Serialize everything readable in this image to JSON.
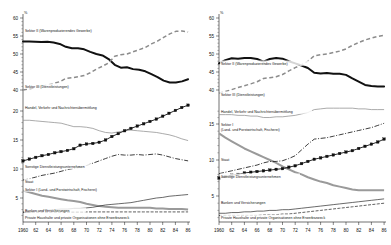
{
  "figure": {
    "unit_symbol": "%",
    "panels": [
      "left",
      "right"
    ]
  },
  "chart_data": [
    {
      "id": "left",
      "type": "line",
      "title": "",
      "xlabel": "",
      "ylabel": "%",
      "grid": false,
      "legend": "inline-labels",
      "x": [
        1960,
        1961,
        1962,
        1963,
        1964,
        1965,
        1966,
        1967,
        1968,
        1969,
        1970,
        1971,
        1972,
        1973,
        1974,
        1975,
        1976,
        1977,
        1978,
        1979,
        1980,
        1981,
        1982,
        1983,
        1984,
        1985,
        1986
      ],
      "xtick_labels": [
        "1960",
        "62",
        "64",
        "66",
        "68",
        "70",
        "72",
        "74",
        "76",
        "78",
        "80",
        "82",
        "84",
        "86"
      ],
      "ytick_labels_upper": [
        "60",
        "55",
        "50",
        "45",
        "40"
      ],
      "ytick_labels_lower": [
        "20",
        "15",
        "10",
        "5"
      ],
      "ylim_upper": [
        38,
        60
      ],
      "ylim_lower": [
        2,
        21
      ],
      "axis_break": true,
      "series": [
        {
          "name": "Sektor II (Warenproduzierendes Gewerbe)",
          "style": "thick-solid-black",
          "axis": "upper",
          "values": [
            53.5,
            53.5,
            53.4,
            53.3,
            53.4,
            53.2,
            52.8,
            52.0,
            51.6,
            51.6,
            51.3,
            50.6,
            50.0,
            49.6,
            48.6,
            47.0,
            46.2,
            46.3,
            45.8,
            45.6,
            45.2,
            44.4,
            43.6,
            42.6,
            42.1,
            42.1,
            42.4,
            43.0
          ]
        },
        {
          "name": "Sektor III (Dienstleistungen)",
          "style": "dashed-grey",
          "axis": "upper",
          "values": [
            40.0,
            40.3,
            40.7,
            41.0,
            41.4,
            41.8,
            42.3,
            43.2,
            43.4,
            43.7,
            44.0,
            44.8,
            45.8,
            46.6,
            47.5,
            49.4,
            49.8,
            50.0,
            50.6,
            51.2,
            51.8,
            52.8,
            53.6,
            54.6,
            55.6,
            56.3,
            56.4,
            56.1
          ]
        },
        {
          "name": "Handel, Verkehr und Nachrichtenübermittlung",
          "style": "thin-grey",
          "axis": "lower",
          "values": [
            18.4,
            18.4,
            18.3,
            18.2,
            18.1,
            18.0,
            17.9,
            17.6,
            17.3,
            17.3,
            17.2,
            17.0,
            16.6,
            16.3,
            16.2,
            16.4,
            16.6,
            16.7,
            16.6,
            16.5,
            16.4,
            16.3,
            16.1,
            15.9,
            15.6,
            15.2,
            14.9
          ]
        },
        {
          "name": "Sonstige Dienstleistungsunternehmen",
          "style": "marker-line-black",
          "axis": "lower",
          "values": [
            11.4,
            11.7,
            12.0,
            12.3,
            12.5,
            12.8,
            13.0,
            13.2,
            13.5,
            14.1,
            14.3,
            14.4,
            14.6,
            15.0,
            15.6,
            16.1,
            16.6,
            17.0,
            17.4,
            17.8,
            18.2,
            18.6,
            19.1,
            19.6,
            20.1,
            20.6,
            21.0
          ]
        },
        {
          "name": "Staat",
          "style": "dash-dot-black",
          "axis": "lower",
          "values": [
            8.1,
            8.3,
            8.6,
            8.9,
            9.1,
            9.3,
            9.6,
            9.9,
            10.1,
            10.3,
            10.6,
            11.0,
            11.4,
            11.8,
            12.2,
            12.5,
            12.4,
            12.4,
            12.5,
            12.4,
            12.5,
            12.6,
            12.4,
            12.1,
            11.8,
            11.6,
            11.4
          ]
        },
        {
          "name": "Sektor I (Land- und Forstwirtschaft, Fischerei)",
          "style": "grey-thick",
          "axis": "lower",
          "values": [
            6.3,
            6.0,
            5.7,
            5.4,
            5.2,
            5.0,
            4.8,
            4.6,
            4.5,
            4.3,
            4.0,
            3.8,
            3.6,
            3.5,
            3.4,
            3.3,
            3.3,
            3.3,
            3.3,
            3.3,
            3.3,
            3.2,
            3.2,
            3.1,
            3.1,
            3.1,
            3.0
          ]
        },
        {
          "name": "Banken und Versicherungen",
          "style": "solid-thin-black",
          "axis": "lower",
          "values": [
            2.5,
            2.6,
            2.7,
            2.8,
            2.9,
            3.0,
            3.1,
            3.1,
            3.2,
            3.2,
            3.3,
            3.4,
            3.6,
            3.8,
            3.9,
            4.0,
            4.1,
            4.2,
            4.4,
            4.6,
            4.8,
            5.0,
            5.1,
            5.3,
            5.4,
            5.5,
            5.6
          ]
        },
        {
          "name": "Private Haushalte und private Organisationen ohne Erwerbszweck",
          "style": "dashed-fine-black",
          "axis": "lower",
          "values": [
            2.6,
            2.6,
            2.6,
            2.6,
            2.6,
            2.6,
            2.6,
            2.6,
            2.6,
            2.6,
            2.6,
            2.6,
            2.6,
            2.6,
            2.6,
            2.6,
            2.6,
            2.6,
            2.6,
            2.6,
            2.6,
            2.6,
            2.6,
            2.6,
            2.6,
            2.6,
            2.6
          ]
        }
      ]
    },
    {
      "id": "right",
      "type": "line",
      "title": "",
      "xlabel": "",
      "ylabel": "%",
      "grid": false,
      "legend": "inline-labels",
      "x": [
        1960,
        1961,
        1962,
        1963,
        1964,
        1965,
        1966,
        1967,
        1968,
        1969,
        1970,
        1971,
        1972,
        1973,
        1974,
        1975,
        1976,
        1977,
        1978,
        1979,
        1980,
        1981,
        1982,
        1983,
        1984,
        1985,
        1986
      ],
      "xtick_labels": [
        "1960",
        "62",
        "64",
        "66",
        "68",
        "70",
        "72",
        "74",
        "76",
        "78",
        "80",
        "82",
        "84",
        "86"
      ],
      "ytick_labels_upper": [
        "60",
        "55",
        "50",
        "45",
        "40"
      ],
      "ytick_labels_lower": [
        "15",
        "10",
        "5"
      ],
      "ylim_upper": [
        38,
        60
      ],
      "ylim_lower": [
        2,
        17
      ],
      "axis_break": true,
      "series": [
        {
          "name": "Sektor II (Warenproduzierendes Gewerbe)",
          "style": "thick-solid-black",
          "axis": "upper",
          "values": [
            47.4,
            48.3,
            48.8,
            48.7,
            48.9,
            48.9,
            48.6,
            47.9,
            48.6,
            48.9,
            48.7,
            48.0,
            47.4,
            46.8,
            46.1,
            44.8,
            44.6,
            44.7,
            44.5,
            44.5,
            44.2,
            43.2,
            42.3,
            41.4,
            41.1,
            41.0,
            41.0
          ]
        },
        {
          "name": "Sektor III (Dienstleistungen)",
          "style": "dashed-grey",
          "axis": "upper",
          "values": [
            39.1,
            39.6,
            40.1,
            40.7,
            41.2,
            41.7,
            42.3,
            43.2,
            43.4,
            43.7,
            44.3,
            45.3,
            46.2,
            47.0,
            48.0,
            49.5,
            49.8,
            50.0,
            50.4,
            50.8,
            51.4,
            52.4,
            53.2,
            53.9,
            54.4,
            54.9,
            55.2
          ]
        },
        {
          "name": "Handel, Verkehr und Nachrichtenübermittlung",
          "style": "thin-grey",
          "axis": "lower",
          "values": [
            16.3,
            16.3,
            16.3,
            16.2,
            16.2,
            16.1,
            16.1,
            15.9,
            15.9,
            16.0,
            16.0,
            16.1,
            16.2,
            16.4,
            16.6,
            17.0,
            17.1,
            17.2,
            17.2,
            17.2,
            17.2,
            17.2,
            17.1,
            17.1,
            17.0,
            17.0,
            17.0
          ]
        },
        {
          "name": "Sektor I (Land- und Forstwirtschaft, Fischerei)",
          "style": "grey-thick",
          "axis": "lower",
          "values": [
            13.7,
            13.1,
            12.6,
            12.1,
            11.6,
            11.2,
            10.8,
            10.4,
            10.0,
            9.6,
            9.1,
            8.7,
            8.3,
            8.0,
            7.6,
            7.3,
            7.0,
            6.8,
            6.5,
            6.3,
            6.1,
            5.9,
            5.8,
            5.8,
            5.8,
            5.8,
            5.8
          ]
        },
        {
          "name": "Staat",
          "style": "dash-dot-black",
          "axis": "lower",
          "values": [
            8.1,
            8.3,
            8.5,
            8.7,
            8.9,
            9.1,
            9.3,
            9.6,
            9.8,
            9.8,
            9.9,
            10.2,
            10.6,
            11.4,
            12.2,
            12.9,
            13.0,
            13.1,
            13.3,
            13.5,
            13.7,
            13.9,
            14.1,
            14.3,
            14.5,
            14.8,
            15.1
          ]
        },
        {
          "name": "Sonstige Dienstleistungsunternehmen",
          "style": "marker-line-black",
          "axis": "lower",
          "values": [
            7.5,
            7.7,
            7.9,
            8.0,
            8.2,
            8.3,
            8.4,
            8.5,
            8.6,
            8.7,
            8.8,
            9.0,
            9.2,
            9.5,
            9.8,
            10.1,
            10.3,
            10.5,
            10.7,
            10.9,
            11.1,
            11.3,
            11.6,
            11.9,
            12.2,
            12.5,
            12.9
          ]
        },
        {
          "name": "Banken und Versicherungen",
          "style": "solid-thin-black",
          "axis": "lower",
          "values": [
            2.6,
            2.6,
            2.7,
            2.7,
            2.8,
            2.8,
            2.9,
            2.9,
            3.0,
            3.0,
            3.1,
            3.1,
            3.2,
            3.3,
            3.4,
            3.5,
            3.6,
            3.7,
            3.8,
            3.9,
            4.0,
            4.1,
            4.2,
            4.3,
            4.4,
            4.5,
            4.6
          ]
        },
        {
          "name": "Private Haushalte und private Organisationen ohne Erwerbszweck",
          "style": "dashed-fine-black",
          "axis": "lower",
          "values": [
            2.3,
            2.3,
            2.3,
            2.3,
            2.3,
            2.3,
            2.3,
            2.4,
            2.4,
            2.4,
            2.5,
            2.5,
            2.6,
            2.7,
            2.8,
            2.9,
            3.0,
            3.1,
            3.2,
            3.3,
            3.4,
            3.5,
            3.6,
            3.7,
            3.8,
            3.9,
            4.0
          ]
        }
      ]
    }
  ],
  "labels": {
    "left": {
      "sektor2": "Sektor II (Warenproduzierendes Gewerbe)",
      "sektor3": "Sektor III (Dienstleistungen)",
      "handel": "Handel, Verkehr und Nachrichtenübermittlung",
      "sonstige": "Sonstige Dienstleistungsunternehmen",
      "staat": "Staat",
      "sektor1": "Sektor I (Land- und Forstwirtschaft, Fischerei)",
      "banken": "Banken und Versicherungen",
      "haushalte": "Private Haushalte und private Organisationen ohne Erwerbszweck"
    },
    "right": {
      "sektor2": "Sektor II (Warenproduzierendes Gewerbe)",
      "sektor3": "Sektor III (Dienstleistungen)",
      "handel": "Handel, Verkehr und Nachrichtenübermittlung",
      "sektor1_l1": "Sektor I",
      "sektor1_l2": "(Land- und Forstwirtschaft, Fischerei)",
      "staat": "Staat",
      "sonstige": "Sonstige Dienstleistungsunternehmen",
      "banken": "Banken und Versicherungen",
      "haushalte": "Private Haushalte und private Organisationen ohne Erwerbszweck"
    }
  },
  "axes": {
    "unit": "%",
    "y_upper": [
      "60",
      "55",
      "50",
      "45",
      "40"
    ],
    "y_lower_left": [
      "20",
      "15",
      "10",
      "5"
    ],
    "y_lower_right": [
      "15",
      "10",
      "5"
    ],
    "x": [
      "1960",
      "62",
      "64",
      "66",
      "68",
      "70",
      "72",
      "74",
      "76",
      "78",
      "80",
      "82",
      "84",
      "86"
    ]
  },
  "colors": {
    "ink": "#111111",
    "grey": "#8f8f8f",
    "paper": "#ffffff"
  }
}
